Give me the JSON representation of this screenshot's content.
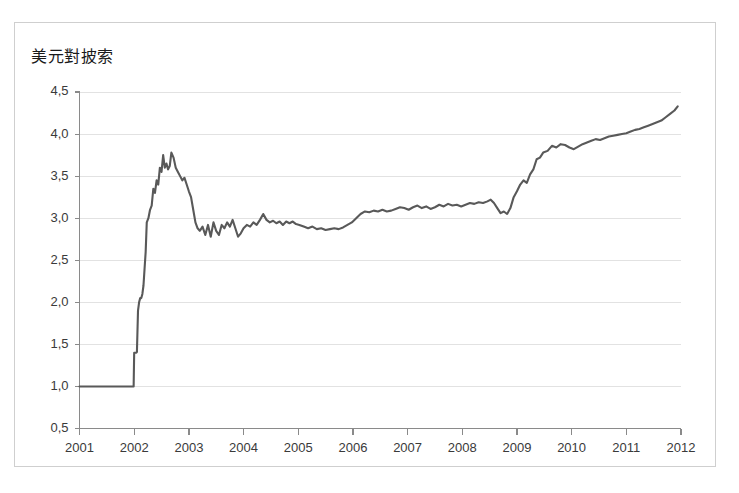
{
  "figure": {
    "title": "美元對披索",
    "border_color": "#cfcfcf",
    "background": "#ffffff"
  },
  "chart_data": {
    "type": "line",
    "title": "美元對披索",
    "xlabel": "",
    "ylabel": "",
    "xlim": [
      2001,
      2012
    ],
    "ylim": [
      0.5,
      4.5
    ],
    "grid": true,
    "legend": "none",
    "line_color": "#595959",
    "x_tick_labels": [
      "2001",
      "2002",
      "2003",
      "2004",
      "2005",
      "2006",
      "2007",
      "2008",
      "2009",
      "2010",
      "2011",
      "2012"
    ],
    "y_tick_labels": [
      "4,5",
      "4,0",
      "3,5",
      "3,0",
      "2,5",
      "2,0",
      "1,5",
      "1,0",
      "0,5"
    ],
    "y_tick_values": [
      4.5,
      4.0,
      3.5,
      3.0,
      2.5,
      2.0,
      1.5,
      1.0,
      0.5
    ],
    "series": [
      {
        "name": "USD/ARS",
        "x": [
          2001.0,
          2001.1,
          2001.2,
          2001.3,
          2001.4,
          2001.5,
          2001.6,
          2001.7,
          2001.8,
          2001.9,
          2001.99,
          2002.0,
          2002.02,
          2002.04,
          2002.05,
          2002.07,
          2002.09,
          2002.11,
          2002.13,
          2002.15,
          2002.17,
          2002.19,
          2002.21,
          2002.23,
          2002.26,
          2002.29,
          2002.32,
          2002.35,
          2002.38,
          2002.41,
          2002.44,
          2002.47,
          2002.5,
          2002.53,
          2002.56,
          2002.59,
          2002.62,
          2002.65,
          2002.68,
          2002.72,
          2002.76,
          2002.8,
          2002.84,
          2002.88,
          2002.92,
          2002.96,
          2003.0,
          2003.04,
          2003.08,
          2003.12,
          2003.16,
          2003.2,
          2003.25,
          2003.3,
          2003.35,
          2003.4,
          2003.45,
          2003.5,
          2003.55,
          2003.6,
          2003.65,
          2003.7,
          2003.75,
          2003.8,
          2003.85,
          2003.9,
          2003.95,
          2004.0,
          2004.06,
          2004.12,
          2004.18,
          2004.24,
          2004.3,
          2004.36,
          2004.42,
          2004.48,
          2004.54,
          2004.6,
          2004.66,
          2004.72,
          2004.78,
          2004.84,
          2004.9,
          2004.96,
          2005.02,
          2005.1,
          2005.18,
          2005.26,
          2005.34,
          2005.42,
          2005.5,
          2005.58,
          2005.66,
          2005.74,
          2005.82,
          2005.9,
          2005.98,
          2006.06,
          2006.14,
          2006.22,
          2006.3,
          2006.38,
          2006.46,
          2006.54,
          2006.62,
          2006.7,
          2006.78,
          2006.86,
          2006.94,
          2007.02,
          2007.1,
          2007.18,
          2007.26,
          2007.34,
          2007.42,
          2007.5,
          2007.58,
          2007.66,
          2007.74,
          2007.82,
          2007.9,
          2007.98,
          2008.06,
          2008.14,
          2008.22,
          2008.3,
          2008.38,
          2008.46,
          2008.52,
          2008.58,
          2008.64,
          2008.7,
          2008.76,
          2008.82,
          2008.88,
          2008.94,
          2009.0,
          2009.06,
          2009.12,
          2009.18,
          2009.24,
          2009.3,
          2009.36,
          2009.42,
          2009.48,
          2009.56,
          2009.64,
          2009.72,
          2009.8,
          2009.88,
          2009.96,
          2010.04,
          2010.12,
          2010.2,
          2010.28,
          2010.36,
          2010.44,
          2010.52,
          2010.6,
          2010.68,
          2010.76,
          2010.84,
          2010.92,
          2011.0,
          2011.08,
          2011.16,
          2011.24,
          2011.32,
          2011.4,
          2011.48,
          2011.56,
          2011.64,
          2011.72,
          2011.8,
          2011.88,
          2011.94
        ],
        "values": [
          1.0,
          1.0,
          1.0,
          1.0,
          1.0,
          1.0,
          1.0,
          1.0,
          1.0,
          1.0,
          1.0,
          1.4,
          1.4,
          1.4,
          1.41,
          1.9,
          2.0,
          2.05,
          2.05,
          2.1,
          2.2,
          2.4,
          2.6,
          2.95,
          3.0,
          3.1,
          3.15,
          3.35,
          3.3,
          3.45,
          3.4,
          3.6,
          3.55,
          3.75,
          3.6,
          3.65,
          3.58,
          3.62,
          3.78,
          3.72,
          3.6,
          3.55,
          3.5,
          3.45,
          3.48,
          3.4,
          3.32,
          3.25,
          3.1,
          2.95,
          2.88,
          2.85,
          2.9,
          2.8,
          2.92,
          2.78,
          2.95,
          2.85,
          2.8,
          2.92,
          2.88,
          2.95,
          2.9,
          2.98,
          2.88,
          2.78,
          2.82,
          2.88,
          2.92,
          2.9,
          2.95,
          2.92,
          2.98,
          3.05,
          2.98,
          2.95,
          2.97,
          2.94,
          2.96,
          2.92,
          2.96,
          2.94,
          2.96,
          2.93,
          2.92,
          2.9,
          2.88,
          2.9,
          2.87,
          2.88,
          2.86,
          2.87,
          2.88,
          2.87,
          2.89,
          2.92,
          2.95,
          3.0,
          3.05,
          3.08,
          3.07,
          3.09,
          3.08,
          3.1,
          3.08,
          3.09,
          3.11,
          3.13,
          3.12,
          3.1,
          3.13,
          3.15,
          3.12,
          3.14,
          3.11,
          3.13,
          3.16,
          3.14,
          3.17,
          3.15,
          3.16,
          3.14,
          3.16,
          3.18,
          3.17,
          3.19,
          3.18,
          3.2,
          3.22,
          3.18,
          3.12,
          3.06,
          3.08,
          3.05,
          3.12,
          3.25,
          3.32,
          3.4,
          3.45,
          3.42,
          3.52,
          3.58,
          3.7,
          3.72,
          3.78,
          3.8,
          3.86,
          3.84,
          3.88,
          3.87,
          3.84,
          3.82,
          3.85,
          3.88,
          3.9,
          3.92,
          3.94,
          3.93,
          3.95,
          3.97,
          3.98,
          3.99,
          4.0,
          4.01,
          4.03,
          4.05,
          4.06,
          4.08,
          4.1,
          4.12,
          4.14,
          4.16,
          4.2,
          4.24,
          4.28,
          4.33
        ]
      }
    ]
  }
}
